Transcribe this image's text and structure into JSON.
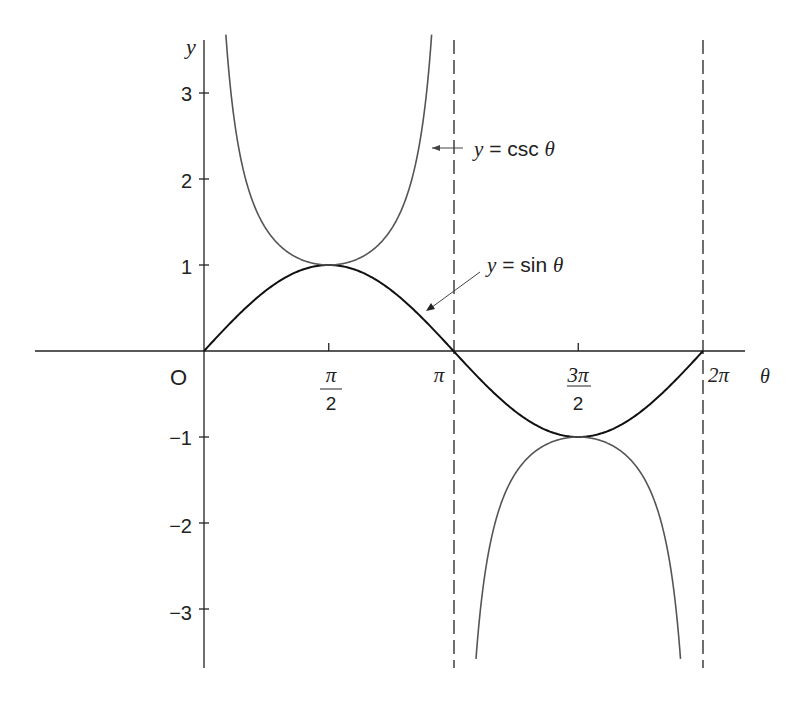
{
  "chart_data": {
    "type": "line",
    "title": "",
    "xlabel": "θ",
    "ylabel": "y",
    "origin_label": "O",
    "x_ticks": [
      {
        "value": 1.5708,
        "label_num": "π",
        "label_den": "2"
      },
      {
        "value": 3.1416,
        "label": "π"
      },
      {
        "value": 4.7124,
        "label_num": "3π",
        "label_den": "2"
      },
      {
        "value": 6.2832,
        "label": "2π"
      }
    ],
    "y_ticks": [
      {
        "value": 3,
        "label": "3"
      },
      {
        "value": 2,
        "label": "2"
      },
      {
        "value": 1,
        "label": "1"
      },
      {
        "value": -1,
        "label": "−1"
      },
      {
        "value": -2,
        "label": "−2"
      },
      {
        "value": -3,
        "label": "−3"
      }
    ],
    "xlim": [
      -2.1,
      7.6
    ],
    "ylim": [
      -3.6,
      3.6
    ],
    "grid": false,
    "asymptotes": [
      3.1416,
      6.2832
    ],
    "series": [
      {
        "name": "y = sin θ",
        "function": "sin",
        "domain": [
          0,
          6.2832
        ],
        "x": [
          0,
          0.7854,
          1.5708,
          2.3562,
          3.1416,
          3.927,
          4.7124,
          5.4978,
          6.2832
        ],
        "values": [
          0,
          0.707,
          1,
          0.707,
          0,
          -0.707,
          -1,
          -0.707,
          0
        ]
      },
      {
        "name": "y = csc θ",
        "function": "csc",
        "domain": [
          0,
          6.2832
        ],
        "x": [
          0.2945,
          0.5236,
          0.7854,
          1.5708,
          2.3562,
          2.618,
          2.847,
          3.436,
          3.665,
          3.927,
          4.7124,
          5.4978,
          5.76,
          5.989
        ],
        "values": [
          3.45,
          2,
          1.414,
          1,
          1.414,
          2,
          3.45,
          -3.45,
          -2,
          -1.414,
          -1,
          -1.414,
          -2,
          -3.45
        ]
      }
    ],
    "annotations": [
      {
        "text_y": "y",
        "text_eq": " = csc ",
        "text_var": "θ",
        "points_to": "csc curve near θ≈2.95"
      },
      {
        "text_y": "y",
        "text_eq": " = sin ",
        "text_var": "θ",
        "points_to": "sin curve near θ≈2.5"
      }
    ]
  }
}
